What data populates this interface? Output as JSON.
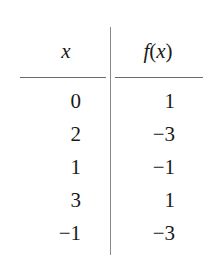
{
  "table": {
    "headers": {
      "x": "x",
      "fx_name": "f",
      "fx_open": "(",
      "fx_arg": "x",
      "fx_close": ")"
    },
    "columns": [
      "x",
      "f(x)"
    ],
    "rows": [
      {
        "x": "0",
        "fx": "1"
      },
      {
        "x": "2",
        "fx": "−3"
      },
      {
        "x": "1",
        "fx": "−1"
      },
      {
        "x": "3",
        "fx": "1"
      },
      {
        "x": "−1",
        "fx": "−3"
      }
    ]
  }
}
